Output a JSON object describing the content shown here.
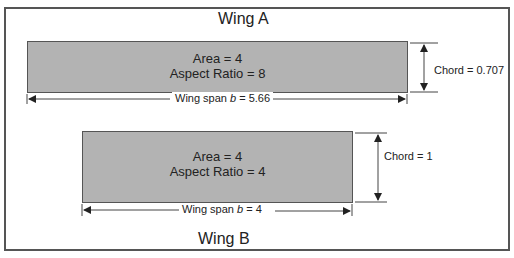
{
  "diagram": {
    "wing_a": {
      "title": "Wing A",
      "area_label": "Area = 4",
      "aspect_ratio_label": "Aspect Ratio = 8",
      "span_label_prefix": "Wing span ",
      "span_symbol": "b",
      "span_label_suffix": " = 5.66",
      "chord_label": "Chord = 0.707",
      "area": 4,
      "aspect_ratio": 8,
      "span": 5.66,
      "chord": 0.707
    },
    "wing_b": {
      "title": "Wing B",
      "area_label": "Area = 4",
      "aspect_ratio_label": "Aspect Ratio = 4",
      "span_label_prefix": "Wing span ",
      "span_symbol": "b",
      "span_label_suffix": " = 4",
      "chord_label": "Chord = 1",
      "area": 4,
      "aspect_ratio": 4,
      "span": 4,
      "chord": 1
    },
    "colors": {
      "wing_fill": "#b3b3b3",
      "outline": "#555555",
      "text": "#222222"
    }
  }
}
